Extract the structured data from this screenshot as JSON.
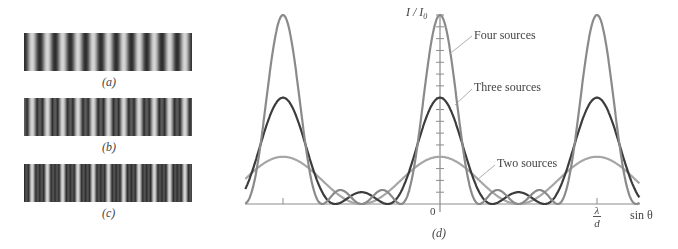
{
  "panels": {
    "a": {
      "caption": "(a)",
      "type": "two-source fringes",
      "fringe_count": 11,
      "sharpness": 2
    },
    "b": {
      "caption": "(b)",
      "type": "three-source fringes",
      "fringe_count": 11,
      "sharpness": 3
    },
    "c": {
      "caption": "(c)",
      "type": "four-source fringes",
      "fringe_count": 11,
      "sharpness": 4
    }
  },
  "graph": {
    "caption": "(d)",
    "y_axis_label": "I / I",
    "y_axis_label_sub": "0",
    "origin_label": "0",
    "x_tick_label_num": "λ",
    "x_tick_label_den": "d",
    "x_axis_label": "sin θ",
    "labels": {
      "four": "Four sources",
      "three": "Three sources",
      "two": "Two sources"
    }
  },
  "chart_data": {
    "type": "line",
    "title": "",
    "xlabel": "sin θ",
    "ylabel": "I/I0",
    "x_range_in_lambda_over_d": [
      -1.24,
      1.27
    ],
    "ylim": [
      0,
      16
    ],
    "y_ticks_count": 16,
    "x_ticks": [
      "-λ/d",
      "0",
      "λ/d"
    ],
    "series": [
      {
        "name": "Four sources",
        "N": 4,
        "peak": 16,
        "color": "#8a8a8a"
      },
      {
        "name": "Three sources",
        "N": 3,
        "peak": 9,
        "color": "#3c3c3c"
      },
      {
        "name": "Two sources",
        "N": 2,
        "peak": 4,
        "color": "#a6a6a6"
      }
    ],
    "formula": "I/I0 = sin^2(N·π·d·sinθ/λ) / sin^2(π·d·sinθ/λ)",
    "grid": false
  },
  "colors": {
    "four": "#8a8a8a",
    "three": "#3c3c3c",
    "two": "#a6a6a6",
    "axis": "#8c8c8c",
    "fringe_dark": "#2e2e2e",
    "fringe_light": "#d6d6d6"
  }
}
